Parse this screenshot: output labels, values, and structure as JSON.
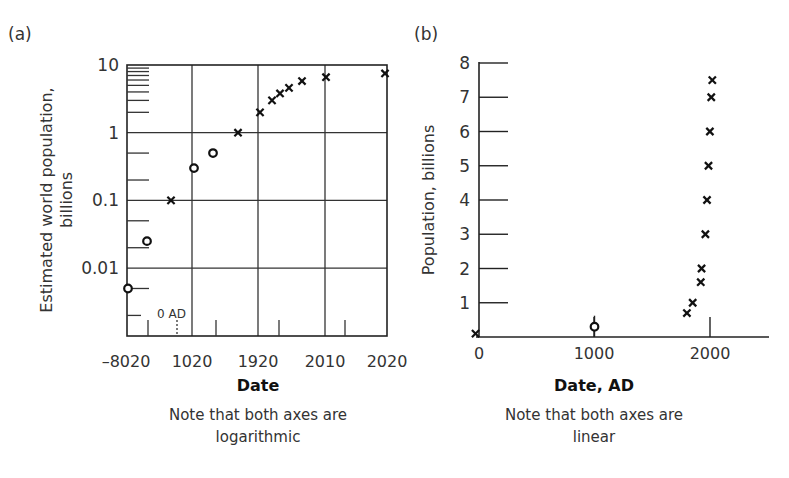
{
  "panels": {
    "a": {
      "label": "(a)"
    },
    "b": {
      "label": "(b)"
    }
  },
  "chart_data": [
    {
      "type": "scatter",
      "panel": "(a)",
      "title": "",
      "xlabel": "Date",
      "ylabel_line1": "Estimated world population,",
      "ylabel_line2": "billions",
      "yscale": "log",
      "xscale": "log (years before 2020, reversed)",
      "ylim": [
        0.001,
        10
      ],
      "y_ticks": [
        "10",
        "1",
        "0.1",
        "0.01"
      ],
      "y_tick_values": [
        10,
        1,
        0.1,
        0.01
      ],
      "x_tick_labels": [
        "–8020",
        "1020",
        "1920",
        "2010",
        "2020"
      ],
      "x_annotation": "0 AD",
      "grid": true,
      "note_line1": "Note that both axes are",
      "note_line2": "logarithmic",
      "series": [
        {
          "name": "estimate (circle)",
          "marker": "o",
          "points": [
            {
              "px": 128,
              "value": 0.005
            },
            {
              "px": 147,
              "value": 0.025
            },
            {
              "px": 194,
              "value": 0.3
            },
            {
              "px": 213,
              "value": 0.5
            }
          ]
        },
        {
          "name": "estimate (cross)",
          "marker": "x",
          "points": [
            {
              "px": 171,
              "value": 0.1
            },
            {
              "px": 238,
              "value": 1.0
            },
            {
              "px": 260,
              "value": 2.0
            },
            {
              "px": 272,
              "value": 3.0
            },
            {
              "px": 280,
              "value": 3.8
            },
            {
              "px": 289,
              "value": 4.6
            },
            {
              "px": 302,
              "value": 5.8
            },
            {
              "px": 326,
              "value": 6.6
            },
            {
              "px": 385,
              "value": 7.5
            }
          ]
        }
      ]
    },
    {
      "type": "scatter",
      "panel": "(b)",
      "title": "",
      "xlabel": "Date, AD",
      "ylabel": "Population, billions",
      "yscale": "linear",
      "xscale": "linear",
      "xlim": [
        0,
        2500
      ],
      "ylim": [
        0,
        8
      ],
      "x_ticks": [
        "0",
        "1000",
        "2000"
      ],
      "x_tick_values": [
        0,
        1000,
        2000
      ],
      "y_ticks": [
        "1",
        "2",
        "3",
        "4",
        "5",
        "6",
        "7",
        "8"
      ],
      "y_tick_values": [
        1,
        2,
        3,
        4,
        5,
        6,
        7,
        8
      ],
      "grid": false,
      "note_line1": "Note that both axes are",
      "note_line2": "linear",
      "series": [
        {
          "name": "estimate (circle)",
          "marker": "o",
          "points": [
            {
              "year": 1000,
              "value": 0.3
            }
          ]
        },
        {
          "name": "estimate (cross)",
          "marker": "x",
          "points": [
            {
              "year": -30,
              "value": 0.1
            },
            {
              "year": 1800,
              "value": 0.7
            },
            {
              "year": 1850,
              "value": 1.0
            },
            {
              "year": 1920,
              "value": 1.6
            },
            {
              "year": 1927,
              "value": 2.0
            },
            {
              "year": 1960,
              "value": 3.0
            },
            {
              "year": 1974,
              "value": 4.0
            },
            {
              "year": 1987,
              "value": 5.0
            },
            {
              "year": 1999,
              "value": 6.0
            },
            {
              "year": 2011,
              "value": 7.0
            },
            {
              "year": 2020,
              "value": 7.5
            }
          ]
        }
      ]
    }
  ]
}
